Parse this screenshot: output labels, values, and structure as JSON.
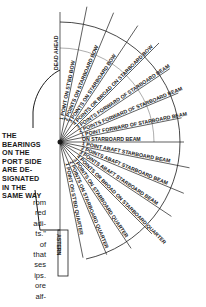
{
  "diagram": {
    "center": {
      "x": 60,
      "y": 142
    },
    "bearings": [
      {
        "label": "DEAD AHEAD",
        "points": 0
      },
      {
        "label": "1 POINT ON ST'BD BOW",
        "points": 1
      },
      {
        "label": "2 POINTS ON STARBOARD BOW",
        "points": 2
      },
      {
        "label": "3 POINTS ON STARBOARD BOW",
        "points": 3
      },
      {
        "label": "4 POINTS OR BROAD ON STARBOARD BOW",
        "points": 4
      },
      {
        "label": "3 POINTS FORWARD OF STARBOARD BEAM",
        "points": 5
      },
      {
        "label": "2 POINTS FORWARD OF STARBOARD BEAM",
        "points": 6
      },
      {
        "label": "1 POINT FORWARD OF STARBOARD BEAM",
        "points": 7
      },
      {
        "label": "ON STARBOARD BEAM",
        "points": 8
      },
      {
        "label": "1 POINT ABAFT STARBOARD BEAM",
        "points": 9
      },
      {
        "label": "2 POINTS ABAFT STARBOARD BEAM",
        "points": 10
      },
      {
        "label": "3 POINTS ABAFT STARBOARD BEAM",
        "points": 11
      },
      {
        "label": "4 POINTS OR BROAD ON STARBOARD QUARTER",
        "points": 12
      },
      {
        "label": "3 POINTS ON STARBOARD QUARTER",
        "points": 13
      },
      {
        "label": "2 POINTS ON STARBOARD QUARTER",
        "points": 14
      },
      {
        "label": "1 POINT ON ST'BD QUARTER",
        "points": 15
      },
      {
        "label": "ASTERN",
        "points": 16
      }
    ],
    "note": {
      "lines": [
        "THE",
        "BEARINGS",
        "ON THE",
        "PORT SIDE",
        "ARE DE-",
        "SIGNATED",
        "IN THE",
        "SAME WAY"
      ]
    },
    "body_text_fragment": {
      "lines": [
        "rom",
        "red",
        "adi-",
        "ts.\"",
        "of",
        "that",
        "ses",
        "ips.",
        "ore",
        "alf-"
      ]
    },
    "colors": {
      "ink": "#1a1a1a",
      "background": "#ffffff"
    }
  }
}
